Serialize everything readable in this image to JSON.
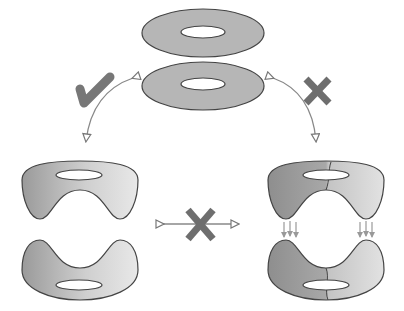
{
  "diagram": {
    "colors": {
      "background": "#ffffff",
      "surface_fill": "#b4b4b4",
      "surface_light": "#e6e6e6",
      "outline": "#444444",
      "arrow": "#888888",
      "mark": "#6e6e6e"
    },
    "nodes": [
      {
        "id": "top-tori",
        "label": "Two stacked tori (flat rings)"
      },
      {
        "id": "left-halves",
        "label": "Two separate U-shaped halves (upper and lower)"
      },
      {
        "id": "right-halves",
        "label": "Two U-shaped halves with seam, glued via arrows"
      }
    ],
    "edges": [
      {
        "from": "top-tori",
        "to": "left-halves",
        "mark": "check-mark",
        "meaning": "allowed"
      },
      {
        "from": "top-tori",
        "to": "right-halves",
        "mark": "x-mark",
        "meaning": "not allowed"
      },
      {
        "from": "left-halves",
        "to": "right-halves",
        "mark": "x-mark",
        "meaning": "not allowed"
      }
    ]
  }
}
